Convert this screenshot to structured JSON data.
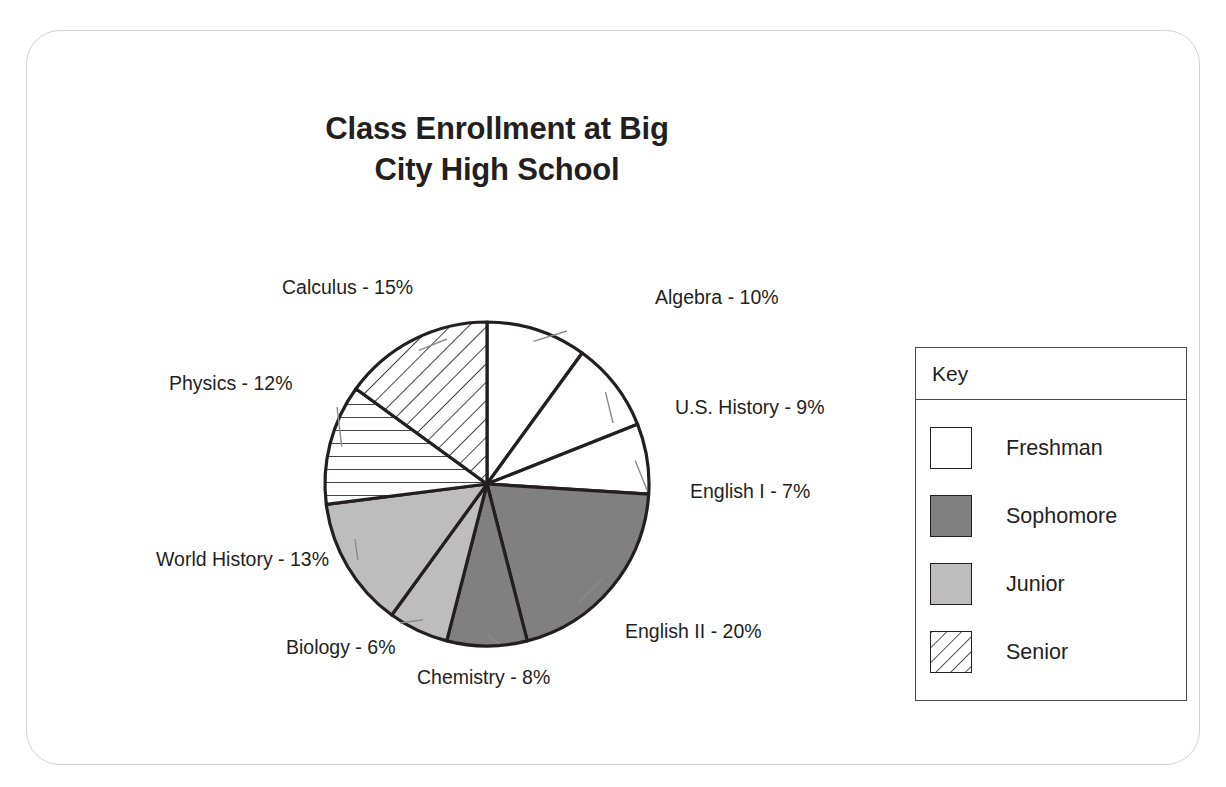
{
  "card": {
    "name": "chart-card"
  },
  "title": "Class Enrollment at Big\nCity High School",
  "chart_data": {
    "type": "pie",
    "title": "Class Enrollment at Big City High School",
    "xlabel": "",
    "ylabel": "",
    "units": "percent",
    "total": 100,
    "legend_position": "right",
    "legend_title": "Key",
    "grid": false,
    "start_angle_deg": 0,
    "direction": "clockwise",
    "categories": [
      "Algebra",
      "U.S. History",
      "English I",
      "English II",
      "Chemistry",
      "Biology",
      "World History",
      "Physics",
      "Calculus"
    ],
    "values": [
      10,
      9,
      7,
      20,
      8,
      6,
      13,
      12,
      15
    ],
    "slices": [
      {
        "label": "Algebra - 10%",
        "name": "Algebra",
        "value": 10,
        "group": "Freshman",
        "fill": "#ffffff",
        "pattern": "solid"
      },
      {
        "label": "U.S. History - 9%",
        "name": "U.S. History",
        "value": 9,
        "group": "Freshman",
        "fill": "#ffffff",
        "pattern": "solid"
      },
      {
        "label": "English I - 7%",
        "name": "English I",
        "value": 7,
        "group": "Freshman",
        "fill": "#ffffff",
        "pattern": "solid"
      },
      {
        "label": "English II - 20%",
        "name": "English II",
        "value": 20,
        "group": "Sophomore",
        "fill": "#808080",
        "pattern": "solid"
      },
      {
        "label": "Chemistry - 8%",
        "name": "Chemistry",
        "value": 8,
        "group": "Sophomore",
        "fill": "#808080",
        "pattern": "solid"
      },
      {
        "label": "Biology - 6%",
        "name": "Biology",
        "value": 6,
        "group": "Junior",
        "fill": "#bdbdbd",
        "pattern": "solid"
      },
      {
        "label": "World History - 13%",
        "name": "World History",
        "value": 13,
        "group": "Junior",
        "fill": "#bdbdbd",
        "pattern": "solid"
      },
      {
        "label": "Physics - 12%",
        "name": "Physics",
        "value": 12,
        "group": "Senior",
        "fill": "#ffffff",
        "pattern": "hatch-horizontal"
      },
      {
        "label": "Calculus - 15%",
        "name": "Calculus",
        "value": 15,
        "group": "Senior",
        "fill": "#ffffff",
        "pattern": "hatch-diagonal"
      }
    ]
  },
  "legend": {
    "title": "Key",
    "items": [
      {
        "label": "Freshman",
        "fill": "#ffffff",
        "pattern": "solid"
      },
      {
        "label": "Sophomore",
        "fill": "#808080",
        "pattern": "solid"
      },
      {
        "label": "Junior",
        "fill": "#bdbdbd",
        "pattern": "solid"
      },
      {
        "label": "Senior",
        "fill": "#ffffff",
        "pattern": "hatch-diagonal"
      }
    ]
  },
  "colors": {
    "freshman": "#ffffff",
    "sophomore": "#808080",
    "junior": "#bdbdbd",
    "senior_hatch": "#ffffff",
    "outline": "#231f20",
    "card_border": "#d4d4d4",
    "background": "#ffffff"
  }
}
